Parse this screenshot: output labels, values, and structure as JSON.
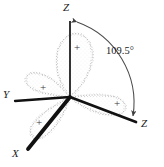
{
  "figure": {
    "background_color": "#ffffff",
    "axis_color": "#111111",
    "lobe_stipple_color": "#9a9a9a",
    "arc_color": "#4a4a4a",
    "origin": {
      "x": 70,
      "y": 97
    }
  },
  "axes": [
    {
      "id": "z-up",
      "label": "Z",
      "label_x": 63,
      "label_y": 2,
      "end_x": 70,
      "end_y": 22,
      "width": 1.6
    },
    {
      "id": "y-left",
      "label": "Y",
      "label_x": 3,
      "label_y": 94,
      "end_x": 16,
      "end_y": 100,
      "width": 2.2
    },
    {
      "id": "x-lower-left",
      "label": "X",
      "label_x": 12,
      "label_y": 150,
      "end_x": 30,
      "end_y": 147,
      "width": 3.6
    },
    {
      "id": "z-lower-right",
      "label": "Z",
      "label_x": 140,
      "label_y": 122,
      "end_x": 135,
      "end_y": 121,
      "width": 2.6
    }
  ],
  "lobes": [
    {
      "id": "lobe-z-up",
      "sign": "+",
      "sign_x": 74,
      "sign_y": 43
    },
    {
      "id": "lobe-y-left",
      "sign": "+",
      "sign_x": 40,
      "sign_y": 89
    },
    {
      "id": "lobe-x-lower-left",
      "sign": "+",
      "sign_x": 35,
      "sign_y": 122
    },
    {
      "id": "lobe-z-lower-right",
      "sign": "+",
      "sign_x": 115,
      "sign_y": 104
    }
  ],
  "angle_annotation": {
    "value": "109.5°",
    "label_x": 108,
    "label_y": 50,
    "arc_from_axis": "z-up",
    "arc_to_axis": "z-lower-right"
  }
}
